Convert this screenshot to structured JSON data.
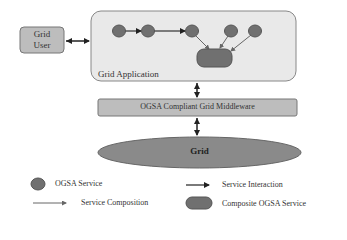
{
  "diagram": {
    "grid_user": {
      "label_line1": "Grid",
      "label_line2": "User"
    },
    "grid_application": {
      "label": "Grid Application"
    },
    "middleware": {
      "label": "OGSA Compliant Grid Middleware"
    },
    "grid": {
      "label": "Grid"
    },
    "nodes": [
      {
        "id": "s1",
        "type": "ogsa-service"
      },
      {
        "id": "s2",
        "type": "ogsa-service"
      },
      {
        "id": "s3",
        "type": "ogsa-service"
      },
      {
        "id": "s4",
        "type": "ogsa-service"
      },
      {
        "id": "s5",
        "type": "ogsa-service"
      },
      {
        "id": "c1",
        "type": "composite-ogsa-service"
      }
    ],
    "edges": [
      {
        "from": "s1",
        "to": "s2",
        "type": "service-interaction"
      },
      {
        "from": "s2",
        "to": "s3",
        "type": "service-interaction"
      },
      {
        "from": "s3",
        "to": "c1",
        "type": "service-composition"
      },
      {
        "from": "s4",
        "to": "c1",
        "type": "service-composition"
      },
      {
        "from": "s5",
        "to": "c1",
        "type": "service-composition"
      },
      {
        "from": "grid-user",
        "to": "grid-application",
        "type": "bidirectional"
      },
      {
        "from": "grid-application",
        "to": "middleware",
        "type": "bidirectional"
      },
      {
        "from": "middleware",
        "to": "grid",
        "type": "bidirectional"
      }
    ]
  },
  "legend": {
    "ogsa_service": "OGSA Service",
    "service_interaction": "Service Interaction",
    "service_composition": "Service Composition",
    "composite_ogsa_service": "Composite OGSA Service"
  },
  "colors": {
    "app_bg": "#e9e9e9",
    "box_fill": "#bdbdbd",
    "node_fill": "#707070",
    "grid_fill": "#8a8a8a"
  }
}
